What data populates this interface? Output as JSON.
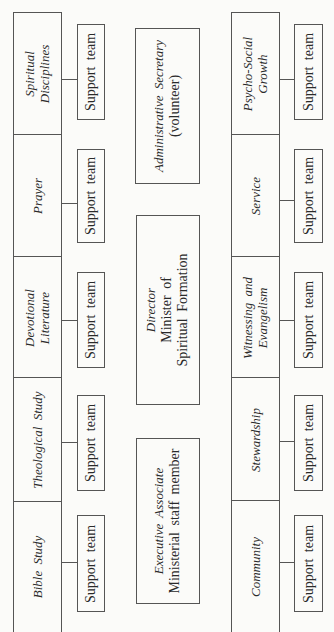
{
  "diagram": {
    "orientation": "rotated-90-ccw",
    "left_column": [
      {
        "title_line1": "Spiritual",
        "title_line2": "Disciplines",
        "support": "Support team"
      },
      {
        "title_line1": "Prayer",
        "title_line2": "",
        "support": "Support team"
      },
      {
        "title_line1": "Devotional",
        "title_line2": "Literature",
        "support": "Support team"
      },
      {
        "title_line1": "Theological Study",
        "title_line2": "",
        "support": "Support team"
      },
      {
        "title_line1": "Bible Study",
        "title_line2": "",
        "support": "Support team"
      }
    ],
    "center": {
      "admin": {
        "title": "Administrative Secretary",
        "subtitle": "(volunteer)"
      },
      "director": {
        "title": "Director",
        "line2": "Minister of",
        "line3": "Spiritual Formation"
      },
      "executive": {
        "title": "Executive Associate",
        "subtitle": "Ministerial staff member"
      }
    },
    "right_column": [
      {
        "title_line1": "Psycho-Social",
        "title_line2": "Growth",
        "support": "Support team"
      },
      {
        "title_line1": "Service",
        "title_line2": "",
        "support": "Support team"
      },
      {
        "title_line1": "Witnessing and",
        "title_line2": "Evangelism",
        "support": "Support team"
      },
      {
        "title_line1": "Stewardship",
        "title_line2": "",
        "support": "Support team"
      },
      {
        "title_line1": "Community",
        "title_line2": "",
        "support": "Support team"
      }
    ]
  }
}
